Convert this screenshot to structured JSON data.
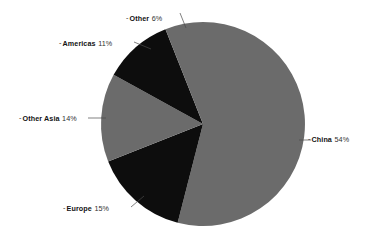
{
  "chart_data": {
    "type": "pie",
    "title": "",
    "subtitle": "",
    "xlabel": "",
    "ylabel": "",
    "legend_position": "none",
    "grid": false,
    "units": "percent",
    "total": 100,
    "start_angle_deg": 0,
    "direction": "clockwise",
    "categories": [
      "China",
      "Europe",
      "Other Asia",
      "Americas",
      "Other"
    ],
    "values": [
      54,
      15,
      14,
      11,
      6
    ],
    "slices": [
      {
        "label": "China",
        "value": 54,
        "value_text": "54%",
        "color": "#6b6b6b",
        "start_deg": 0,
        "end_deg": 194.4,
        "label_marker": "-"
      },
      {
        "label": "Europe",
        "value": 15,
        "value_text": "15%",
        "color": "#0d0d0d",
        "start_deg": 194.4,
        "end_deg": 248.4,
        "label_marker": "-"
      },
      {
        "label": "Other Asia",
        "value": 14,
        "value_text": "14%",
        "color": "#6b6b6b",
        "start_deg": 248.4,
        "end_deg": 298.8,
        "label_marker": "-"
      },
      {
        "label": "Americas",
        "value": 11,
        "value_text": "11%",
        "color": "#0d0d0d",
        "start_deg": 298.8,
        "end_deg": 338.4,
        "label_marker": "-"
      },
      {
        "label": "Other",
        "value": 6,
        "value_text": "6%",
        "color": "#6b6b6b",
        "start_deg": 338.4,
        "end_deg": 360,
        "label_marker": "-"
      }
    ],
    "colors": {
      "slice_gray": "#6b6b6b",
      "slice_black": "#0d0d0d",
      "leader_line": "#4a4a4a",
      "background": "#ffffff",
      "text": "#121212"
    },
    "geometry": {
      "center_x": 203,
      "center_y": 124,
      "radius": 102
    }
  }
}
